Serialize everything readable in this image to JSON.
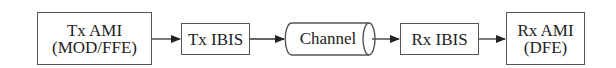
{
  "diagram": {
    "type": "block-flow",
    "blocks": [
      {
        "id": "tx-ami",
        "lines": [
          "Tx AMI",
          "(MOD/FFE)"
        ]
      },
      {
        "id": "tx-ibis",
        "lines": [
          "Tx IBIS"
        ]
      },
      {
        "id": "channel",
        "lines": [
          "Channel"
        ],
        "shape": "cylinder"
      },
      {
        "id": "rx-ibis",
        "lines": [
          "Rx IBIS"
        ]
      },
      {
        "id": "rx-ami",
        "lines": [
          "Rx AMI",
          "(DFE)"
        ]
      }
    ],
    "edges": [
      {
        "from": "tx-ami",
        "to": "tx-ibis"
      },
      {
        "from": "tx-ibis",
        "to": "channel"
      },
      {
        "from": "channel",
        "to": "rx-ibis"
      },
      {
        "from": "rx-ibis",
        "to": "rx-ami"
      }
    ],
    "colors": {
      "stroke": "#555555",
      "text": "#222222",
      "background": "#ffffff"
    }
  }
}
